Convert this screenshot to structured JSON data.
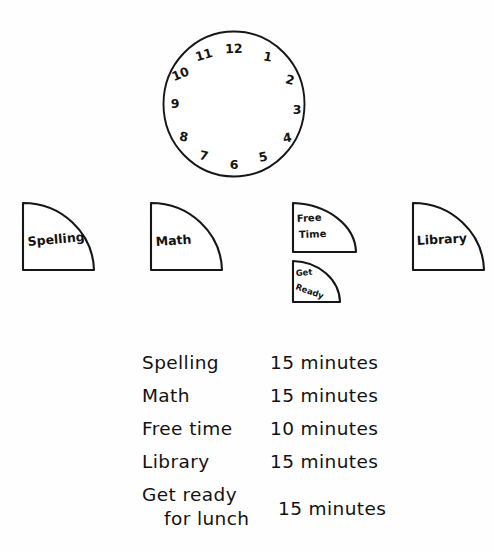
{
  "worksheet": {
    "title": "Clock and schedule pie-sector worksheet",
    "ink_color": "#141414",
    "paper_color": "#fefefe"
  },
  "clock": {
    "name": "blank-clock-face",
    "numbers": [
      "1",
      "2",
      "3",
      "4",
      "5",
      "6",
      "7",
      "8",
      "9",
      "10",
      "11",
      "12"
    ],
    "has_hands": false
  },
  "sectors": [
    {
      "id": "spelling",
      "label": "Spelling",
      "minutes": 15,
      "degrees": 90
    },
    {
      "id": "math",
      "label": "Math",
      "minutes": 15,
      "degrees": 90
    },
    {
      "id": "free-time",
      "label_line1": "Free",
      "label_line2": "Time",
      "minutes": 10,
      "degrees": 60
    },
    {
      "id": "get-ready",
      "label_line1": "Get",
      "label_line2": "Ready",
      "minutes": 15,
      "degrees": 90
    },
    {
      "id": "library",
      "label": "Library",
      "minutes": 15,
      "degrees": 90
    }
  ],
  "legend": {
    "rows": [
      {
        "name": "Spelling",
        "name_line2": "",
        "value": "15 minutes"
      },
      {
        "name": "Math",
        "name_line2": "",
        "value": "15 minutes"
      },
      {
        "name": "Free time",
        "name_line2": "",
        "value": "10 minutes"
      },
      {
        "name": "Library",
        "name_line2": "",
        "value": "15 minutes"
      },
      {
        "name": "Get ready",
        "name_line2": "for lunch",
        "value": "15 minutes"
      }
    ]
  }
}
